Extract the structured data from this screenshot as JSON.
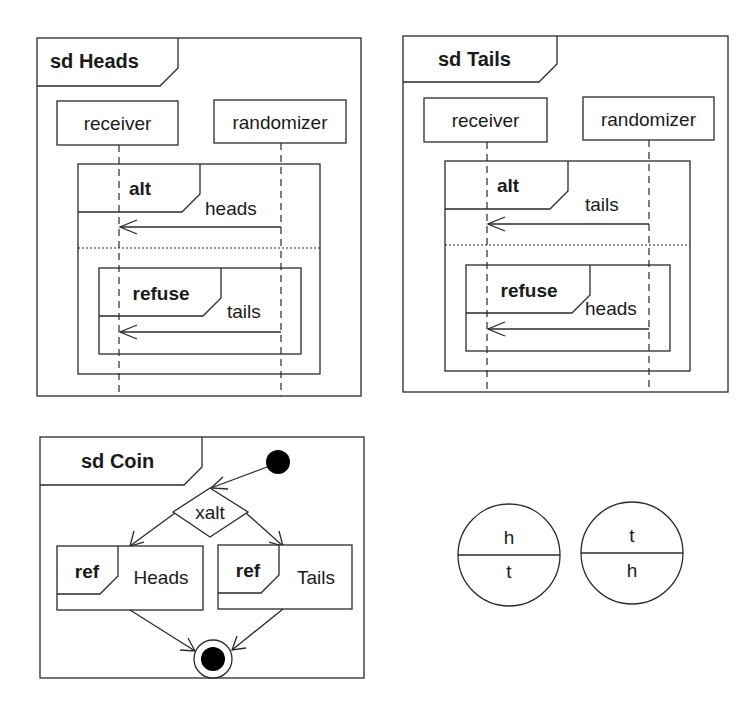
{
  "diagrams": {
    "heads": {
      "frame_title": "sd Heads",
      "lifelines": [
        "receiver",
        "randomizer"
      ],
      "alt": {
        "operator": "alt",
        "guard": "heads",
        "refuse": {
          "operator": "refuse",
          "guard": "tails"
        }
      }
    },
    "tails": {
      "frame_title": "sd Tails",
      "lifelines": [
        "receiver",
        "randomizer"
      ],
      "alt": {
        "operator": "alt",
        "guard": "tails",
        "refuse": {
          "operator": "refuse",
          "guard": "heads"
        }
      }
    },
    "coin": {
      "frame_title": "sd Coin",
      "decision_label": "xalt",
      "refs": [
        {
          "keyword": "ref",
          "name": "Heads"
        },
        {
          "keyword": "ref",
          "name": "Tails"
        }
      ]
    },
    "coins": [
      {
        "top": "h",
        "bottom": "t"
      },
      {
        "top": "t",
        "bottom": "h"
      }
    ]
  },
  "colors": {
    "line": "#2a2a2a",
    "fill": "#ffffff",
    "node": "#000000"
  }
}
